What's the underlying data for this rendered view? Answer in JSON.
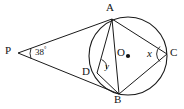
{
  "figure": {
    "type": "circle-geometry-diagram",
    "stroke_color": "#1a1a1a",
    "background_color": "#ffffff"
  },
  "circle": {
    "center_label": "O",
    "center_x": 128,
    "center_y": 56,
    "radius": 39
  },
  "points": [
    {
      "label": "A",
      "x": 112,
      "y": 19,
      "label_x": 108,
      "label_y": 3
    },
    {
      "label": "B",
      "x": 119,
      "y": 94,
      "label_x": 115,
      "label_y": 95
    },
    {
      "label": "C",
      "x": 167,
      "y": 54,
      "label_x": 170,
      "label_y": 47
    },
    {
      "label": "D",
      "x": 97,
      "y": 73,
      "label_x": 84,
      "label_y": 67
    },
    {
      "label": "O",
      "x": 128,
      "y": 56,
      "label_x": 118,
      "label_y": 48
    },
    {
      "label": "P",
      "x": 18,
      "y": 53,
      "label_x": 6,
      "label_y": 45
    }
  ],
  "angles": [
    {
      "name": "angle-at-p",
      "value": "38",
      "unit": "°",
      "label_x": 32,
      "label_y": 46
    },
    {
      "name": "angle-x-at-c",
      "value": "x",
      "label_x": 148,
      "label_y": 48
    },
    {
      "name": "angle-y-at-d",
      "value": "y",
      "label_x": 106,
      "label_y": 62
    }
  ],
  "segments": [
    {
      "name": "segment-p-a",
      "from": "P",
      "to": "A"
    },
    {
      "name": "segment-p-b",
      "from": "P",
      "to": "B"
    },
    {
      "name": "segment-a-b",
      "from": "A",
      "to": "B"
    },
    {
      "name": "segment-a-c",
      "from": "A",
      "to": "C"
    },
    {
      "name": "segment-a-d",
      "from": "A",
      "to": "D"
    },
    {
      "name": "segment-b-c",
      "from": "B",
      "to": "C"
    },
    {
      "name": "segment-b-d",
      "from": "B",
      "to": "D"
    },
    {
      "name": "segment-a-o-b-diagonal",
      "from": "A",
      "to": "B"
    }
  ]
}
